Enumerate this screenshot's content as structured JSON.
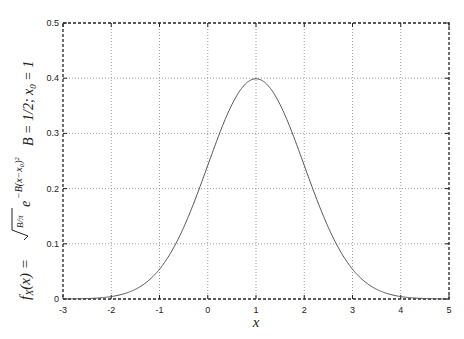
{
  "chart_data": {
    "type": "line",
    "title": "",
    "xlabel": "x",
    "ylabel": "f_X(x) = sqrt(B/pi) e^{-B(x-x0)^2}",
    "annotation": "B = 1/2; x0 = 1",
    "xlim": [
      -3,
      5
    ],
    "ylim": [
      0,
      0.5
    ],
    "grid": true,
    "legend": "none",
    "x_ticks": [
      "-3",
      "-2",
      "-1",
      "0",
      "1",
      "2",
      "3",
      "4",
      "5"
    ],
    "y_ticks": [
      "0",
      "0.1",
      "0.2",
      "0.3",
      "0.4",
      "0.5"
    ],
    "params": {
      "B": 0.5,
      "x0": 1
    },
    "series": [
      {
        "name": "f_X(x)",
        "x": [
          -3,
          -2.5,
          -2,
          -1.5,
          -1,
          -0.5,
          0,
          0.25,
          0.5,
          0.75,
          1,
          1.25,
          1.5,
          1.75,
          2,
          2.5,
          3,
          3.5,
          4,
          4.5,
          5
        ],
        "values": [
          0.0001,
          0.0009,
          0.0044,
          0.0175,
          0.054,
          0.1295,
          0.242,
          0.3011,
          0.3521,
          0.3867,
          0.3989,
          0.3867,
          0.3521,
          0.3011,
          0.242,
          0.1295,
          0.054,
          0.0175,
          0.0044,
          0.0009,
          0.0001
        ]
      }
    ]
  },
  "labels": {
    "xlabel": "x",
    "annotation_left": "B = 1/2;  x",
    "annotation_sub": "0",
    "annotation_right": " = 1",
    "ylabel_main": "f",
    "ylabel_sub": "X",
    "ylabel_rest": "(x) = ",
    "ylabel_frac": "B/π",
    "ylabel_exp": "−B(x−x₀)²"
  }
}
